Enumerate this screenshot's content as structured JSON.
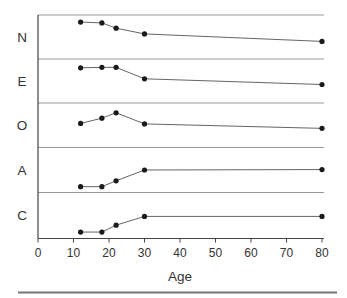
{
  "chart_data": {
    "type": "line",
    "title": "",
    "xlabel": "Age",
    "ylabel": "",
    "x_values": [
      12,
      18,
      22,
      30,
      80
    ],
    "xlim": [
      0,
      80
    ],
    "xticks": [
      0,
      10,
      20,
      30,
      40,
      50,
      60,
      70,
      80
    ],
    "x_tick_labels": [
      "0",
      "10",
      "20",
      "30",
      "40",
      "50",
      "60",
      "70",
      "80"
    ],
    "value_scale": "fraction of panel strip height (0 = strip bottom line, 1 = strip top line); no y-axis ticks shown",
    "series": [
      {
        "name": "N",
        "values": [
          0.84,
          0.82,
          0.7,
          0.57,
          0.4
        ]
      },
      {
        "name": "E",
        "values": [
          0.8,
          0.81,
          0.81,
          0.55,
          0.42
        ]
      },
      {
        "name": "O",
        "values": [
          0.54,
          0.66,
          0.78,
          0.53,
          0.43
        ]
      },
      {
        "name": "A",
        "values": [
          0.13,
          0.13,
          0.26,
          0.5,
          0.51
        ]
      },
      {
        "name": "C",
        "values": [
          0.14,
          0.14,
          0.29,
          0.48,
          0.48
        ]
      }
    ],
    "layout": {
      "panels": "5 stacked horizontal strips sharing one x axis, trait label at left of each strip",
      "legend": "none",
      "grid": "off",
      "marker": "filled circle"
    }
  },
  "colors": {
    "marker": "#1a1a1a",
    "series_line": "#666666",
    "panel_divider": "#999999",
    "axis": "#444444",
    "text": "#333333",
    "bottom_rule": "#777777",
    "background": "#ffffff"
  }
}
